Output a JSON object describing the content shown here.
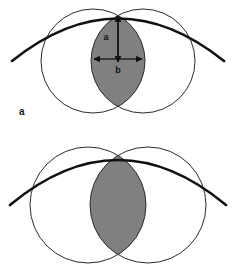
{
  "figure": {
    "type": "geometric-diagram",
    "background_color": "#ffffff",
    "shaded_color": "#808080",
    "thin_stroke_color": "#2b2b2b",
    "thick_stroke_color": "#111111",
    "panels": [
      {
        "id": "a",
        "label": "a",
        "description": "Two overlapping circles with a large shaded lens-shaped intersection, crossed by a thick arc tangent at the top of the lens; the lens height is labeled a and its width is labeled b.",
        "annotations": [
          {
            "name": "height-dimension",
            "label": "a",
            "orientation": "vertical"
          },
          {
            "name": "width-dimension",
            "label": "b",
            "orientation": "horizontal"
          }
        ],
        "shapes": {
          "left_circle": {
            "cx": 93,
            "cy": 61,
            "r": 52
          },
          "right_circle": {
            "cx": 143,
            "cy": 61,
            "r": 52
          },
          "arc": {
            "apex_x": 118,
            "apex_y": 14,
            "left_x": 12,
            "left_y": 61,
            "right_x": 224,
            "right_y": 61
          }
        }
      },
      {
        "id": "b",
        "label": "b",
        "description": "Two overlapping circles spaced farther apart producing a narrow shaded lens-shaped intersection, crossed by a thick arc passing above the lens.",
        "annotations": [],
        "shapes": {
          "left_circle": {
            "cx": 88,
            "cy": 68,
            "r": 58
          },
          "right_circle": {
            "cx": 148,
            "cy": 68,
            "r": 58
          },
          "arc": {
            "apex_x": 118,
            "apex_y": 18,
            "left_x": 10,
            "left_y": 68,
            "right_x": 226,
            "right_y": 68
          }
        }
      }
    ]
  }
}
